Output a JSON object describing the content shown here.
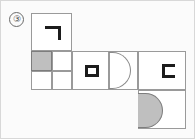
{
  "figure": {
    "index_label": "③",
    "caption": "",
    "type": "cube-net-diagram",
    "background_color": "#fbfbfb",
    "line_color": "#9a9a9a",
    "glyph_color": "#1c1c1c",
    "shade_color": "#bfbfbf"
  },
  "cells": [
    {
      "id": "cell-top-corner",
      "name": "top-cell-with-corner-glyph",
      "glyph": "corner-bracket-icon",
      "x": 30,
      "y": 12,
      "w": 41,
      "h": 38
    },
    {
      "id": "cell-quadrants",
      "name": "quadrant-cell-with-shaded-square",
      "glyph": "shaded-quadrant",
      "x": 30,
      "y": 50,
      "w": 41,
      "h": 39
    },
    {
      "id": "cell-square",
      "name": "cell-with-hollow-square-glyph",
      "glyph": "hollow-square-icon",
      "x": 71,
      "y": 50,
      "w": 37,
      "h": 39
    },
    {
      "id": "cell-semicircle-outline",
      "name": "cell-with-outline-semicircle-glyph",
      "glyph": "semicircle-outline-icon",
      "x": 108,
      "y": 50,
      "w": 29,
      "h": 39
    },
    {
      "id": "cell-cbracket",
      "name": "cell-with-c-bracket-glyph",
      "glyph": "c-bracket-icon",
      "x": 137,
      "y": 50,
      "w": 48,
      "h": 39
    },
    {
      "id": "cell-semicircle-filled",
      "name": "cell-with-filled-semicircle-glyph",
      "glyph": "semicircle-filled-icon",
      "x": 137,
      "y": 89,
      "w": 48,
      "h": 39
    }
  ],
  "quadrants": [
    {
      "name": "quadrant-top-left",
      "shaded": true,
      "x": 30,
      "y": 50,
      "w": 21,
      "h": 20
    },
    {
      "name": "quadrant-top-right",
      "shaded": false,
      "x": 51,
      "y": 50,
      "w": 20,
      "h": 20
    },
    {
      "name": "quadrant-bottom-left",
      "shaded": false,
      "x": 30,
      "y": 70,
      "w": 21,
      "h": 19
    },
    {
      "name": "quadrant-bottom-right",
      "shaded": false,
      "x": 51,
      "y": 70,
      "w": 20,
      "h": 19
    }
  ],
  "glyphs": {
    "corner": {
      "name": "corner-bracket-icon",
      "x": 43,
      "y": 24,
      "w": 16,
      "h": 14
    },
    "square": {
      "name": "hollow-square-icon",
      "x": 83,
      "y": 63,
      "w": 14,
      "h": 12
    },
    "cbracket": {
      "name": "c-bracket-icon",
      "x": 160,
      "y": 62,
      "w": 13,
      "h": 14
    },
    "semicircle_outline": {
      "name": "semicircle-outline-icon",
      "x": 108,
      "y": 51,
      "w": 21,
      "h": 37
    },
    "semicircle_filled": {
      "name": "semicircle-filled-icon",
      "x": 137,
      "y": 92,
      "w": 24,
      "h": 34
    }
  }
}
